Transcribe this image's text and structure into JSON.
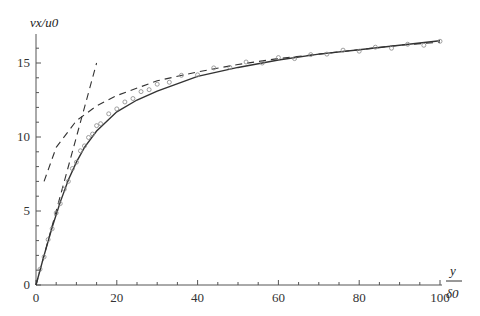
{
  "chart_data": {
    "type": "line",
    "title": "",
    "xlabel": "y/δ0",
    "xlabel_num": "y",
    "xlabel_den": "δ0",
    "ylabel": "vx/u0",
    "xlim": [
      0,
      100
    ],
    "ylim": [
      0,
      17
    ],
    "x_ticks": [
      0,
      20,
      40,
      60,
      80,
      100
    ],
    "y_ticks": [
      0,
      5,
      10,
      15
    ],
    "grid": false,
    "legend": null,
    "series": [
      {
        "name": "model (solid)",
        "style": "solid",
        "x": [
          0,
          2,
          4,
          6,
          8,
          10,
          12,
          15,
          20,
          25,
          30,
          40,
          50,
          60,
          70,
          80,
          90,
          100
        ],
        "y": [
          0,
          2.0,
          3.9,
          5.6,
          7.1,
          8.3,
          9.3,
          10.4,
          11.7,
          12.5,
          13.1,
          14.1,
          14.7,
          15.2,
          15.6,
          15.9,
          16.2,
          16.5
        ]
      },
      {
        "name": "linear law (dashed)",
        "style": "dashed",
        "x": [
          0,
          15
        ],
        "y": [
          0,
          15
        ]
      },
      {
        "name": "log law (dashed)",
        "style": "dashed",
        "x": [
          2,
          5,
          10,
          15,
          20,
          30,
          40,
          50,
          60,
          70,
          80,
          90,
          100
        ],
        "y": [
          7.0,
          9.3,
          11.1,
          12.1,
          12.8,
          13.8,
          14.4,
          14.9,
          15.3,
          15.6,
          15.9,
          16.2,
          16.4
        ]
      },
      {
        "name": "data (circles)",
        "style": "markers",
        "x": [
          1,
          2,
          3,
          4,
          5,
          6,
          7,
          8,
          9,
          10,
          11,
          12,
          13,
          14,
          15,
          16,
          18,
          20,
          22,
          24,
          26,
          28,
          30,
          33,
          36,
          40,
          44,
          48,
          52,
          56,
          60,
          64,
          68,
          72,
          76,
          80,
          84,
          88,
          92,
          96,
          100
        ],
        "y": [
          1.0,
          2.0,
          3.0,
          3.9,
          4.8,
          5.6,
          6.4,
          7.1,
          7.8,
          8.4,
          9.0,
          9.5,
          9.9,
          10.3,
          10.7,
          11.0,
          11.5,
          12.0,
          12.3,
          12.7,
          13.0,
          13.3,
          13.5,
          13.8,
          14.1,
          14.3,
          14.6,
          14.8,
          15.0,
          15.1,
          15.3,
          15.4,
          15.5,
          15.7,
          15.8,
          15.9,
          16.0,
          16.1,
          16.2,
          16.3,
          16.4
        ]
      }
    ]
  }
}
